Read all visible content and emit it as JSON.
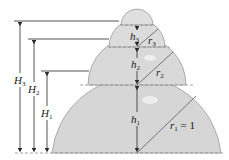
{
  "diagram": {
    "type": "stacked-spherical-caps",
    "colors": {
      "fill": "#d6d6d6",
      "stroke": "#9a9a9a",
      "line": "#2a2a2a",
      "dashed": "#8a8a8a"
    },
    "labels": {
      "H3": {
        "main": "H",
        "sub": "3"
      },
      "H2": {
        "main": "H",
        "sub": "2"
      },
      "H1": {
        "main": "H",
        "sub": "1"
      },
      "h3": {
        "main": "h",
        "sub": "3"
      },
      "h2": {
        "main": "h",
        "sub": "2"
      },
      "h1": {
        "main": "h",
        "sub": "1"
      },
      "r3": {
        "main": "r",
        "sub": "3"
      },
      "r2": {
        "main": "r",
        "sub": "2"
      },
      "r1": {
        "main": "r",
        "sub": "1",
        "suffix": " = 1"
      }
    }
  }
}
